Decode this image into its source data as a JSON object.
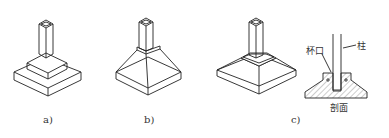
{
  "figures": [
    {
      "id": "a",
      "label": "a)",
      "description": "stepped footing"
    },
    {
      "id": "b",
      "label": "b)",
      "description": "tapered footing"
    },
    {
      "id": "c",
      "label": "c)",
      "description": "cup-socket footing"
    }
  ],
  "section": {
    "cup_label": "杯口",
    "column_label": "柱",
    "section_label": "剖面"
  },
  "colors": {
    "line": "#222222",
    "hatch": "#555555",
    "background": "#ffffff"
  }
}
